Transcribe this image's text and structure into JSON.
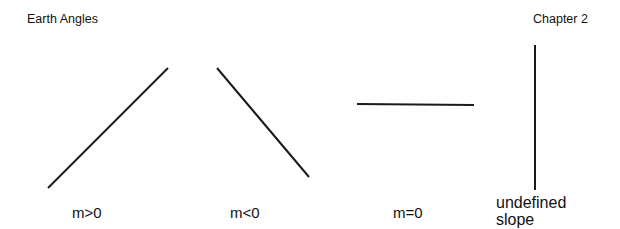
{
  "header": {
    "left_title": "Earth Angles",
    "right_title": "Chapter 2"
  },
  "diagrams": [
    {
      "label": "m>0",
      "line": {
        "x1": 48,
        "y1": 188,
        "x2": 168,
        "y2": 68
      }
    },
    {
      "label": "m<0",
      "line": {
        "x1": 217,
        "y1": 68,
        "x2": 309,
        "y2": 177
      }
    },
    {
      "label": "m=0",
      "line": {
        "x1": 357,
        "y1": 104,
        "x2": 474,
        "y2": 105
      }
    },
    {
      "label_line1": "undefined",
      "label_line2": "slope",
      "line": {
        "x1": 535,
        "y1": 45,
        "x2": 535,
        "y2": 190
      }
    }
  ],
  "colors": {
    "line": "#1a1a1a",
    "background": "#ffffff"
  }
}
